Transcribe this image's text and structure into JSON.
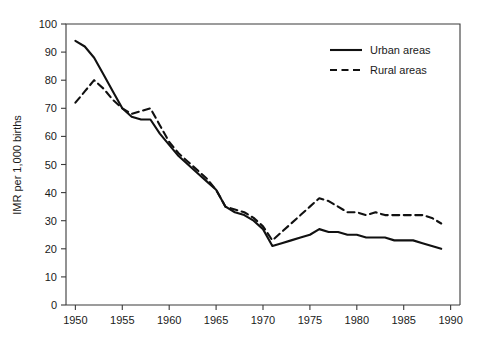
{
  "chart_data": {
    "type": "line",
    "title": "",
    "subtitle": "",
    "xlabel": "",
    "ylabel": "IMR per 1,000 births",
    "xlim": [
      1949,
      1991
    ],
    "ylim": [
      0,
      100
    ],
    "grid": false,
    "legend_position": "top-right",
    "x_ticks": [
      1950,
      1955,
      1960,
      1965,
      1970,
      1975,
      1980,
      1985,
      1990
    ],
    "x_tick_labels": [
      "1950",
      "1955",
      "1960",
      "1965",
      "1970",
      "1975",
      "1980",
      "1985",
      "1990"
    ],
    "y_ticks": [
      0,
      10,
      20,
      30,
      40,
      50,
      60,
      70,
      80,
      90,
      100
    ],
    "y_tick_labels": [
      "0",
      "10",
      "20",
      "30",
      "40",
      "50",
      "60",
      "70",
      "80",
      "90",
      "100"
    ],
    "x": [
      1950,
      1951,
      1952,
      1953,
      1954,
      1955,
      1956,
      1957,
      1958,
      1959,
      1960,
      1961,
      1962,
      1963,
      1964,
      1965,
      1966,
      1967,
      1968,
      1969,
      1970,
      1971,
      1972,
      1973,
      1974,
      1975,
      1976,
      1977,
      1978,
      1979,
      1980,
      1981,
      1982,
      1983,
      1984,
      1985,
      1986,
      1987,
      1988,
      1989
    ],
    "series": [
      {
        "name": "Urban areas",
        "style": "solid",
        "color": "#111111",
        "values": [
          94,
          92,
          88,
          82,
          76,
          70,
          67,
          66,
          66,
          61,
          57,
          53,
          50,
          47,
          44,
          41,
          35,
          33,
          32,
          30,
          27,
          21,
          22,
          23,
          24,
          25,
          27,
          26,
          26,
          25,
          25,
          24,
          24,
          24,
          23,
          23,
          23,
          22,
          21,
          20
        ]
      },
      {
        "name": "Rural areas",
        "style": "dashed",
        "color": "#111111",
        "values": [
          72,
          76,
          80,
          77,
          73,
          70,
          68,
          69,
          70,
          64,
          58,
          54,
          51,
          48,
          45,
          41,
          35,
          34,
          33,
          31,
          28,
          23,
          26,
          29,
          32,
          35,
          38,
          37,
          35,
          33,
          33,
          32,
          33,
          32,
          32,
          32,
          32,
          32,
          31,
          29
        ]
      }
    ],
    "legend_entries": [
      {
        "label": "Urban areas",
        "style": "solid"
      },
      {
        "label": "Rural areas",
        "style": "dashed"
      }
    ]
  }
}
